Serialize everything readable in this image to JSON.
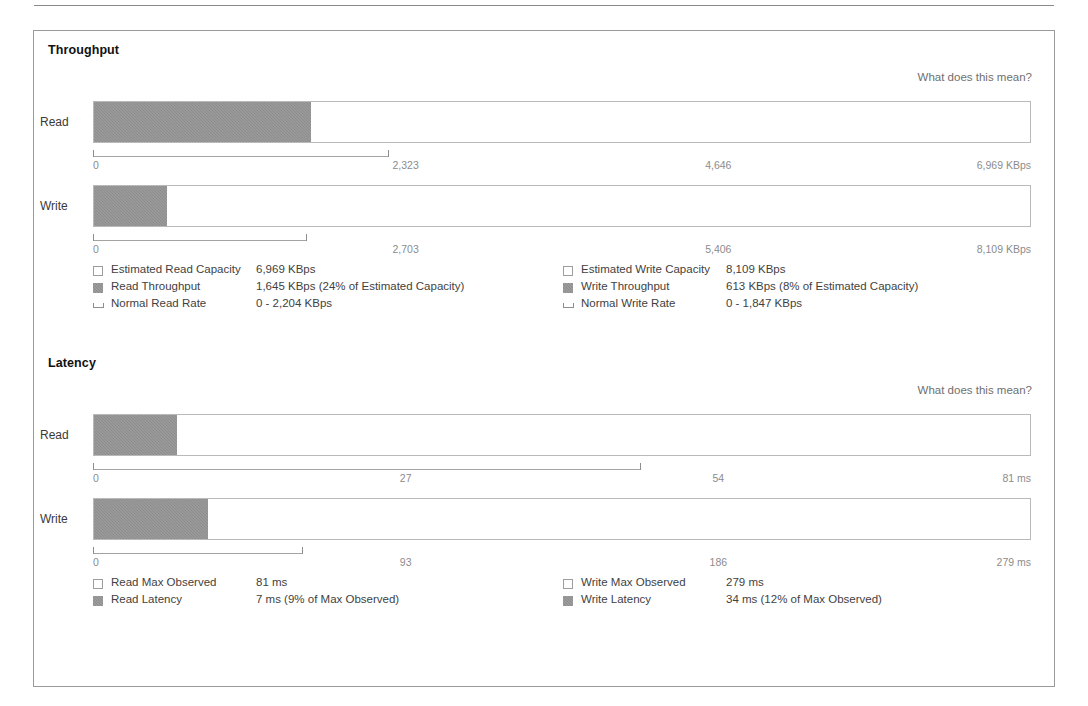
{
  "sections": [
    {
      "title": "Throughput",
      "help_label": "What does this mean?",
      "rows": [
        {
          "label": "Read",
          "fill_pct": 23.2,
          "bracket_pct": 31.6,
          "ticks": [
            "0",
            "2,323",
            "4,646",
            "6,969 KBps"
          ]
        },
        {
          "label": "Write",
          "fill_pct": 7.8,
          "bracket_pct": 22.8,
          "ticks": [
            "0",
            "2,703",
            "5,406",
            "8,109 KBps"
          ]
        }
      ],
      "legend_left": [
        {
          "swatch": "hollow",
          "name": "Estimated Read Capacity",
          "value": "6,969 KBps"
        },
        {
          "swatch": "solid",
          "name": "Read Throughput",
          "value": "1,645 KBps (24% of Estimated Capacity)"
        },
        {
          "swatch": "bracket",
          "name": "Normal Read Rate",
          "value": "0 - 2,204 KBps"
        }
      ],
      "legend_right": [
        {
          "swatch": "hollow",
          "name": "Estimated Write Capacity",
          "value": "8,109 KBps"
        },
        {
          "swatch": "solid",
          "name": "Write Throughput",
          "value": "613 KBps (8% of Estimated Capacity)"
        },
        {
          "swatch": "bracket",
          "name": "Normal Write Rate",
          "value": "0 - 1,847 KBps"
        }
      ]
    },
    {
      "title": "Latency",
      "help_label": "What does this mean?",
      "rows": [
        {
          "label": "Read",
          "fill_pct": 8.9,
          "bracket_pct": 58.4,
          "ticks": [
            "0",
            "27",
            "54",
            "81 ms"
          ]
        },
        {
          "label": "Write",
          "fill_pct": 12.2,
          "bracket_pct": 22.4,
          "ticks": [
            "0",
            "93",
            "186",
            "279 ms"
          ]
        }
      ],
      "legend_left": [
        {
          "swatch": "hollow",
          "name": "Read Max Observed",
          "value": "81 ms"
        },
        {
          "swatch": "solid",
          "name": "Read Latency",
          "value": "7 ms (9% of Max Observed)"
        }
      ],
      "legend_right": [
        {
          "swatch": "hollow",
          "name": "Write Max Observed",
          "value": "279 ms"
        },
        {
          "swatch": "solid",
          "name": "Write Latency",
          "value": "34 ms (12% of Max Observed)"
        }
      ]
    }
  ],
  "colors": {
    "fill": "#8d8d8d",
    "track_border": "#b9b9b9",
    "panel_border": "#9a9a9a",
    "tick_text": "#8c8c8c",
    "link_text": "#6f6f6f"
  }
}
